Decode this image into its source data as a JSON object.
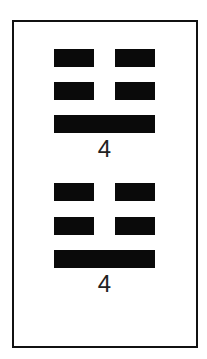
{
  "page": {
    "top_fragment": "",
    "background": "#ffffff",
    "border_color": "#111111",
    "redaction_color": "#0a0a0a"
  },
  "groups": [
    {
      "redacted_fields": [
        {
          "label": "",
          "redacted": true
        },
        {
          "label": "",
          "redacted": true
        },
        {
          "label": "",
          "redacted": true
        },
        {
          "label": "",
          "redacted": true
        }
      ],
      "redacted_wide": {
        "label": "",
        "redacted": true
      },
      "number": "4"
    },
    {
      "redacted_fields": [
        {
          "label": "",
          "redacted": true
        },
        {
          "label": "",
          "redacted": true
        },
        {
          "label": "",
          "redacted": true
        },
        {
          "label": "",
          "redacted": true
        }
      ],
      "redacted_wide": {
        "label": "",
        "redacted": true
      },
      "number": "4"
    }
  ]
}
